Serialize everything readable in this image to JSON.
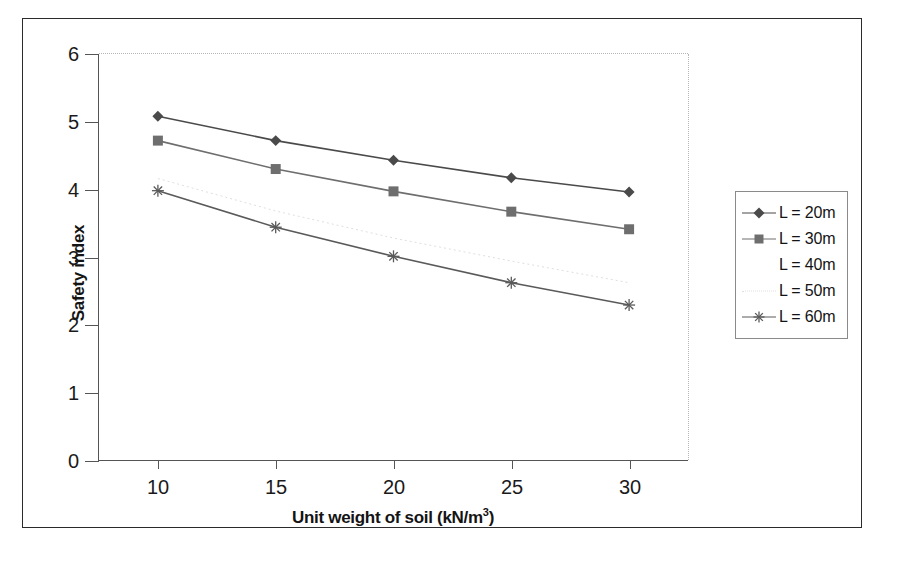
{
  "chart_data": {
    "type": "line",
    "title": "",
    "xlabel": "Unit weight of soil (kN/m3)",
    "xlabel_base": "Unit weight of soil (kN/m",
    "xlabel_sup": "3",
    "xlabel_tail": ")",
    "ylabel": "Safety index",
    "x": [
      10,
      15,
      20,
      25,
      30
    ],
    "xticklabels": [
      "10",
      "15",
      "20",
      "25",
      "30"
    ],
    "yticklabels": [
      "0",
      "1",
      "2",
      "3",
      "4",
      "5",
      "6"
    ],
    "xlim": [
      7.5,
      32.5
    ],
    "ylim": [
      0,
      6
    ],
    "grid": false,
    "legend_position": "right",
    "series": [
      {
        "name": "L = 20m",
        "label": "L = 20m",
        "marker": "diamond",
        "color": "#4a4a4a",
        "visible": true,
        "values": [
          5.08,
          4.72,
          4.43,
          4.17,
          3.96
        ]
      },
      {
        "name": "L = 30m",
        "label": "L = 30m",
        "marker": "square",
        "color": "#6e6e6e",
        "visible": true,
        "values": [
          4.72,
          4.3,
          3.97,
          3.67,
          3.41
        ]
      },
      {
        "name": "L = 40m",
        "label": "L = 40m",
        "marker": "none",
        "color": "#fdfdfd",
        "visible": false,
        "values": [
          4.4,
          3.95,
          3.58,
          3.26,
          2.98
        ]
      },
      {
        "name": "L = 50m",
        "label": "L = 50m",
        "marker": "none",
        "color": "#dedede",
        "visible": true,
        "values": [
          4.16,
          3.68,
          3.28,
          2.94,
          2.62
        ]
      },
      {
        "name": "L = 60m",
        "label": "L = 60m",
        "marker": "asterisk",
        "color": "#5a5a5a",
        "visible": true,
        "values": [
          3.98,
          3.44,
          3.01,
          2.62,
          2.29
        ]
      }
    ]
  },
  "figure": {
    "border_color": "#2b2b2b",
    "background": "#ffffff"
  }
}
